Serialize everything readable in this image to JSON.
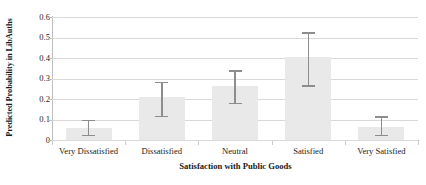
{
  "chart_data": {
    "type": "bar",
    "title": "",
    "xlabel": "Satisfaction with Public Goods",
    "ylabel": "Predicted Probability in LibAuths",
    "categories": [
      "Very Dissatisfied",
      "Dissatisfied",
      "Neutral",
      "Satisfied",
      "Very Satisfied"
    ],
    "values": [
      0.06,
      0.21,
      0.265,
      0.405,
      0.065
    ],
    "error_low": [
      0.02,
      0.11,
      0.175,
      0.26,
      0.02
    ],
    "error_high": [
      0.1,
      0.285,
      0.34,
      0.525,
      0.115
    ],
    "ylim": [
      0,
      0.6
    ],
    "yticks": [
      0,
      0.1,
      0.2,
      0.3,
      0.4,
      0.5,
      0.6
    ],
    "ytick_labels": [
      "0",
      "0.1",
      "0.2",
      "0.3",
      "0.4",
      "0.5",
      "0.6"
    ],
    "grid": true,
    "legend": "none",
    "bar_color": "#e9e9e9",
    "error_color": "#8d8d8d",
    "gridline_color": "#d9d9d9",
    "axis_color": "#bfbfbf"
  }
}
